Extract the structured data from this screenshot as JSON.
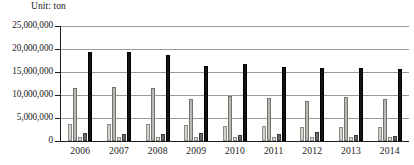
{
  "chart_data": {
    "type": "bar",
    "title": "Unit: ton",
    "unit_label": "Unit: ton",
    "xlabel": "",
    "ylabel": "",
    "ylim": [
      0,
      25000000
    ],
    "ytick_values": [
      0,
      5000000,
      10000000,
      15000000,
      20000000,
      25000000
    ],
    "ytick_labels": [
      "0",
      "5,000,000",
      "10,000,000",
      "15,000,000",
      "20,000,000",
      "25,000,000"
    ],
    "grid": true,
    "legend": "none",
    "categories": [
      "2006",
      "2007",
      "2008",
      "2009",
      "2010",
      "2011",
      "2012",
      "2013",
      "2014"
    ],
    "series": [
      {
        "name": "series-1",
        "color": "#d4d2cd",
        "values": [
          3800000,
          3750000,
          3650000,
          3450000,
          3250000,
          3200000,
          3050000,
          3150000,
          3000000
        ]
      },
      {
        "name": "series-2",
        "color": "#b9b7b1",
        "values": [
          11500000,
          11700000,
          11450000,
          9100000,
          9800000,
          9400000,
          8800000,
          9500000,
          9150000
        ]
      },
      {
        "name": "series-3",
        "color": "#e2e0dc",
        "values": [
          950000,
          900000,
          900000,
          800000,
          780000,
          820000,
          800000,
          850000,
          800000
        ]
      },
      {
        "name": "series-4",
        "color": "#6d6b66",
        "values": [
          1700000,
          1600000,
          1550000,
          1700000,
          1350000,
          1450000,
          1900000,
          1200000,
          1050000
        ]
      },
      {
        "name": "series-5",
        "color": "#151412",
        "values": [
          19300000,
          19250000,
          18800000,
          16200000,
          16700000,
          16000000,
          15900000,
          15900000,
          15700000
        ]
      }
    ]
  }
}
